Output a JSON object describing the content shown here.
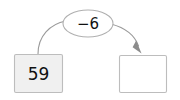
{
  "diagram": {
    "type": "arrow-number-machine",
    "background_color": "#ffffff",
    "input_box": {
      "label": "59",
      "value": "59",
      "fill_color": "#f0f0f0",
      "border_color": "#bdbdbd"
    },
    "operation_bubble": {
      "label": "−6",
      "operator": "−",
      "operand": "6",
      "fill_color": "#ffffff",
      "border_color": "#b0b0b0"
    },
    "output_box": {
      "label": "",
      "value": "",
      "fill_color": "#ffffff",
      "border_color": "#bdbdbd"
    },
    "arrow": {
      "color": "#9a9a9a",
      "head_color": "#8c8c8c",
      "direction": "left-to-right"
    }
  }
}
